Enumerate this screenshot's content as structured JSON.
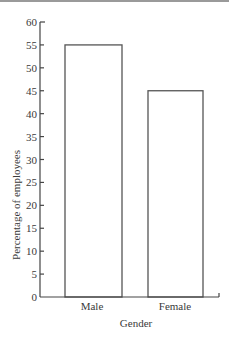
{
  "chart_data": {
    "type": "bar",
    "title": "",
    "xlabel": "Gender",
    "ylabel": "Percentage of employees",
    "categories": [
      "Male",
      "Female"
    ],
    "values": [
      55,
      45
    ],
    "ylim": [
      0,
      60
    ],
    "yticks": [
      0,
      5,
      10,
      15,
      20,
      25,
      30,
      35,
      40,
      45,
      50,
      55,
      60
    ],
    "grid": false,
    "legend": null,
    "bar_fill": "#ffffff",
    "bar_stroke": "#555555"
  }
}
